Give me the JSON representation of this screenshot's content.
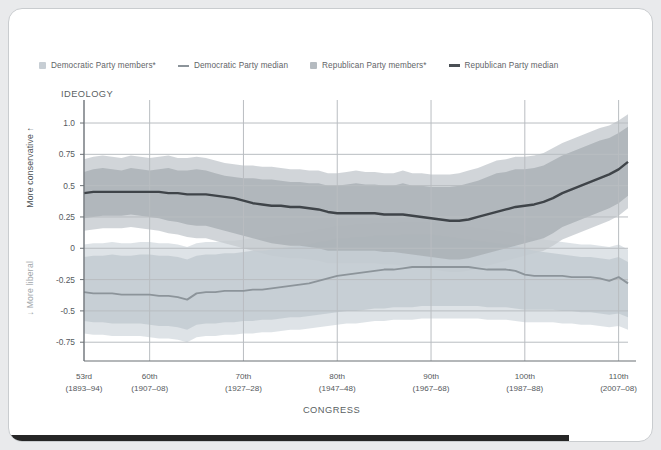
{
  "card": {
    "background": "#ffffff",
    "border": "#c9cccf"
  },
  "legend": {
    "items": [
      {
        "name": "dem-members-swatch",
        "type": "swatch",
        "label": "Democratic Party members*",
        "color": "#c7ced4"
      },
      {
        "name": "dem-median-line",
        "type": "line",
        "label": "Democratic Party median",
        "color": "#8c949a"
      },
      {
        "name": "rep-members-swatch",
        "type": "swatch",
        "label": "Republican Party members*",
        "color": "#b5bbc0"
      },
      {
        "name": "rep-median-line",
        "type": "line",
        "label": "Republican Party median",
        "color": "#4a4f54"
      }
    ]
  },
  "axes": {
    "y_title": "IDEOLOGY",
    "y_label_top": "More conservative ↑",
    "y_label_bottom": "↓ More liberal",
    "x_title": "CONGRESS",
    "y_ticks": [
      "1.0",
      "0.75",
      "0.5",
      "0.25",
      "0",
      "-0.25",
      "-0.5",
      "-0.75"
    ],
    "y_tick_values": [
      1.0,
      0.75,
      0.5,
      0.25,
      0,
      -0.25,
      -0.5,
      -0.75
    ],
    "ylim": [
      -0.9,
      1.12
    ],
    "x_ticks": [
      {
        "congress": "53rd",
        "years": "(1893–94)"
      },
      {
        "congress": "60th",
        "years": "(1907–08)"
      },
      {
        "congress": "70th",
        "years": "(1927–28)"
      },
      {
        "congress": "80th",
        "years": "(1947–48)"
      },
      {
        "congress": "90th",
        "years": "(1967–68)"
      },
      {
        "congress": "100th",
        "years": "(1987–88)"
      },
      {
        "congress": "110th",
        "years": "(2007–08)"
      }
    ],
    "x_tick_positions": [
      53,
      60,
      70,
      80,
      90,
      100,
      110
    ],
    "xlim": [
      53,
      111
    ]
  },
  "caption": {
    "text": "FIGURE 1.1"
  },
  "colors": {
    "gridline": "#b9bdc1",
    "axis": "#6b7075",
    "dem_band_outer": "#d8dee3",
    "dem_band_inner": "#c3cbd1",
    "rep_band_outer": "#c6cbcf",
    "rep_band_inner": "#a9afb4",
    "dem_median": "#8c949a",
    "rep_median": "#3f4449",
    "page_bg": "#e9eaec",
    "dark_bar": "#262626"
  },
  "chart_data": {
    "type": "area",
    "title": "IDEOLOGY",
    "xlabel": "CONGRESS",
    "ylabel": "Ideology (DW-NOMINATE 1st dimension)",
    "xlim": [
      53,
      111
    ],
    "ylim": [
      -0.9,
      1.12
    ],
    "grid": true,
    "legend_position": "top",
    "x": [
      53,
      54,
      55,
      56,
      57,
      58,
      59,
      60,
      61,
      62,
      63,
      64,
      65,
      66,
      67,
      68,
      69,
      70,
      71,
      72,
      73,
      74,
      75,
      76,
      77,
      78,
      79,
      80,
      81,
      82,
      83,
      84,
      85,
      86,
      87,
      88,
      89,
      90,
      91,
      92,
      93,
      94,
      95,
      96,
      97,
      98,
      99,
      100,
      101,
      102,
      103,
      104,
      105,
      106,
      107,
      108,
      109,
      110,
      111
    ],
    "series": [
      {
        "name": "Republican Party median",
        "color": "#3f4449",
        "values": [
          0.44,
          0.45,
          0.45,
          0.45,
          0.45,
          0.45,
          0.45,
          0.45,
          0.45,
          0.44,
          0.44,
          0.43,
          0.43,
          0.43,
          0.42,
          0.41,
          0.4,
          0.38,
          0.36,
          0.35,
          0.34,
          0.34,
          0.33,
          0.33,
          0.32,
          0.31,
          0.29,
          0.28,
          0.28,
          0.28,
          0.28,
          0.28,
          0.27,
          0.27,
          0.27,
          0.26,
          0.25,
          0.24,
          0.23,
          0.22,
          0.22,
          0.23,
          0.25,
          0.27,
          0.29,
          0.31,
          0.33,
          0.34,
          0.35,
          0.37,
          0.4,
          0.44,
          0.47,
          0.5,
          0.53,
          0.56,
          0.59,
          0.63,
          0.69
        ]
      },
      {
        "name": "Republican Party members* 90th percentile",
        "color": "#a9afb4",
        "values": [
          0.61,
          0.63,
          0.64,
          0.63,
          0.62,
          0.64,
          0.63,
          0.62,
          0.63,
          0.64,
          0.62,
          0.62,
          0.63,
          0.62,
          0.6,
          0.58,
          0.57,
          0.56,
          0.56,
          0.55,
          0.55,
          0.54,
          0.53,
          0.53,
          0.52,
          0.52,
          0.5,
          0.5,
          0.51,
          0.52,
          0.51,
          0.51,
          0.5,
          0.5,
          0.52,
          0.5,
          0.5,
          0.49,
          0.49,
          0.49,
          0.5,
          0.52,
          0.54,
          0.57,
          0.6,
          0.61,
          0.63,
          0.63,
          0.64,
          0.66,
          0.7,
          0.74,
          0.77,
          0.8,
          0.83,
          0.86,
          0.88,
          0.92,
          0.97
        ]
      },
      {
        "name": "Republican Party members* 10th percentile",
        "color": "#a9afb4",
        "values": [
          0.24,
          0.25,
          0.26,
          0.26,
          0.26,
          0.27,
          0.26,
          0.25,
          0.24,
          0.22,
          0.21,
          0.19,
          0.18,
          0.18,
          0.16,
          0.14,
          0.12,
          0.1,
          0.08,
          0.06,
          0.04,
          0.03,
          0.02,
          0.02,
          0.01,
          0.0,
          -0.02,
          -0.02,
          -0.02,
          -0.02,
          -0.02,
          -0.02,
          -0.03,
          -0.03,
          -0.04,
          -0.05,
          -0.06,
          -0.07,
          -0.08,
          -0.09,
          -0.09,
          -0.08,
          -0.06,
          -0.04,
          -0.02,
          0.0,
          0.02,
          0.04,
          0.06,
          0.08,
          0.12,
          0.17,
          0.2,
          0.23,
          0.26,
          0.29,
          0.32,
          0.36,
          0.42
        ]
      },
      {
        "name": "Democratic Party median",
        "color": "#8c949a",
        "values": [
          -0.35,
          -0.36,
          -0.36,
          -0.36,
          -0.37,
          -0.37,
          -0.37,
          -0.37,
          -0.38,
          -0.38,
          -0.39,
          -0.41,
          -0.36,
          -0.35,
          -0.35,
          -0.34,
          -0.34,
          -0.34,
          -0.33,
          -0.33,
          -0.32,
          -0.31,
          -0.3,
          -0.29,
          -0.28,
          -0.26,
          -0.24,
          -0.22,
          -0.21,
          -0.2,
          -0.19,
          -0.18,
          -0.17,
          -0.17,
          -0.16,
          -0.15,
          -0.15,
          -0.15,
          -0.15,
          -0.15,
          -0.15,
          -0.15,
          -0.16,
          -0.17,
          -0.17,
          -0.17,
          -0.18,
          -0.21,
          -0.22,
          -0.22,
          -0.22,
          -0.22,
          -0.23,
          -0.23,
          -0.23,
          -0.24,
          -0.26,
          -0.23,
          -0.28
        ]
      },
      {
        "name": "Democratic Party members* 90th percentile",
        "color": "#c3cbd1",
        "values": [
          -0.07,
          -0.06,
          -0.06,
          -0.05,
          -0.06,
          -0.06,
          -0.05,
          -0.05,
          -0.06,
          -0.06,
          -0.07,
          -0.09,
          -0.06,
          -0.05,
          -0.05,
          -0.04,
          -0.04,
          -0.03,
          -0.02,
          -0.02,
          -0.01,
          0.0,
          0.01,
          0.02,
          0.03,
          0.05,
          0.06,
          0.08,
          0.08,
          0.09,
          0.09,
          0.1,
          0.1,
          0.1,
          0.11,
          0.11,
          0.11,
          0.11,
          0.1,
          0.09,
          0.08,
          0.07,
          0.06,
          0.05,
          0.04,
          0.03,
          0.02,
          0.0,
          -0.02,
          -0.03,
          -0.04,
          -0.05,
          -0.06,
          -0.07,
          -0.07,
          -0.08,
          -0.09,
          -0.07,
          -0.11
        ]
      },
      {
        "name": "Democratic Party members* 10th percentile",
        "color": "#c3cbd1",
        "values": [
          -0.58,
          -0.59,
          -0.59,
          -0.6,
          -0.6,
          -0.6,
          -0.6,
          -0.61,
          -0.62,
          -0.62,
          -0.63,
          -0.65,
          -0.61,
          -0.6,
          -0.6,
          -0.59,
          -0.59,
          -0.58,
          -0.58,
          -0.57,
          -0.57,
          -0.56,
          -0.55,
          -0.55,
          -0.54,
          -0.53,
          -0.52,
          -0.51,
          -0.5,
          -0.5,
          -0.49,
          -0.48,
          -0.48,
          -0.47,
          -0.47,
          -0.47,
          -0.46,
          -0.46,
          -0.46,
          -0.46,
          -0.46,
          -0.46,
          -0.46,
          -0.47,
          -0.47,
          -0.47,
          -0.48,
          -0.49,
          -0.49,
          -0.49,
          -0.49,
          -0.5,
          -0.5,
          -0.51,
          -0.51,
          -0.52,
          -0.53,
          -0.52,
          -0.55
        ]
      }
    ]
  }
}
